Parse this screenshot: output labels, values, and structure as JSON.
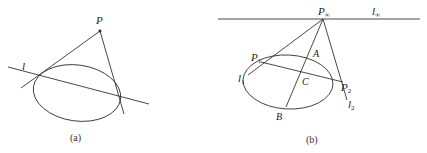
{
  "figure_a": {
    "caption": "(a)",
    "labels": {
      "point": "P",
      "line": "l"
    }
  },
  "figure_b": {
    "caption": "(b)",
    "labels": {
      "point_infinity": "P",
      "point_infinity_sub": "∞",
      "line_infinity": "l",
      "line_infinity_sub": "∞",
      "p1": "P",
      "p1_sub": "1",
      "p2": "P",
      "p2_sub": "2",
      "l1": "l",
      "l1_sub": "1",
      "l2": "l",
      "l2_sub": "2",
      "a": "A",
      "b": "B",
      "c": "C"
    }
  }
}
